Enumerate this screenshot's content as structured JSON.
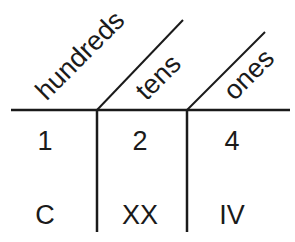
{
  "diagram": {
    "type": "place-value-chart",
    "headers": [
      {
        "key": "hundreds",
        "label": "hundreds"
      },
      {
        "key": "tens",
        "label": "tens"
      },
      {
        "key": "ones",
        "label": "ones"
      }
    ],
    "rows": [
      {
        "name": "arabic",
        "cells": [
          "1",
          "2",
          "4"
        ]
      },
      {
        "name": "roman",
        "cells": [
          "C",
          "XX",
          "IV"
        ]
      }
    ],
    "line_color": "#1a1a1a"
  }
}
